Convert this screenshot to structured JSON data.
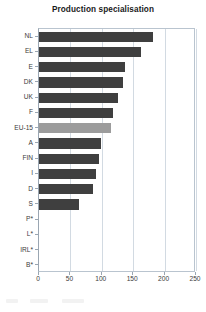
{
  "chart_data": {
    "type": "bar",
    "orientation": "horizontal",
    "title": "Production specialisation",
    "xlabel": "",
    "ylabel": "",
    "categories": [
      "NL",
      "EL",
      "E",
      "DK",
      "UK",
      "F",
      "EU-15",
      "A",
      "FIN",
      "I",
      "D",
      "S",
      "P*",
      "L*",
      "IRL*",
      "B*"
    ],
    "values": [
      181,
      162,
      137,
      134,
      126,
      118,
      115,
      99,
      96,
      91,
      86,
      64,
      null,
      null,
      null,
      null
    ],
    "highlight_category": "EU-15",
    "xlim": [
      0,
      250
    ],
    "xticks": [
      0,
      50,
      100,
      150,
      200,
      250
    ],
    "xtick_labels": [
      "0",
      "50",
      "100",
      "150",
      "200",
      "250"
    ],
    "grid": "vertical",
    "legend": null,
    "series": [
      {
        "name": "Production specialisation",
        "values": [
          181,
          162,
          137,
          134,
          126,
          118,
          115,
          99,
          96,
          91,
          86,
          64,
          null,
          null,
          null,
          null
        ]
      }
    ]
  },
  "colors": {
    "bar": "#3f3f3f",
    "bar_highlight": "#9c9c9c",
    "gridline": "#d2dae2",
    "axis": "#9aa6b2",
    "plot_border": "#b9c4cf",
    "background": "#ffffff",
    "text": "#3b3b3b",
    "title_text": "#1a1a1a"
  }
}
